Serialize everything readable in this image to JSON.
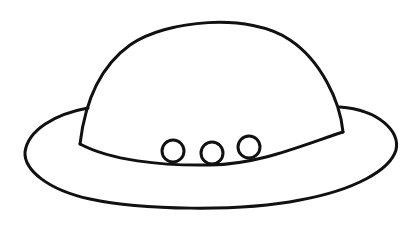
{
  "image": {
    "subject": "hat line drawing",
    "background": "#ffffff",
    "stroke_color": "#111111",
    "stroke_width": 3,
    "parts": [
      "crown",
      "brim",
      "hat-band",
      "buttons"
    ],
    "button_count": 3
  }
}
